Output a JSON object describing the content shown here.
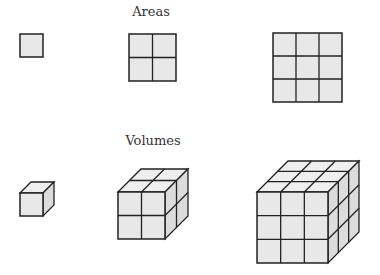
{
  "sections": {
    "areas": {
      "title": "Areas",
      "items": [
        {
          "label": "1x1 square",
          "n": 1
        },
        {
          "label": "2x2 square",
          "n": 2
        },
        {
          "label": "3x3 square",
          "n": 3
        }
      ]
    },
    "volumes": {
      "title": "Volumes",
      "items": [
        {
          "label": "1x1x1 cube",
          "n": 1
        },
        {
          "label": "2x2x2 cube",
          "n": 2
        },
        {
          "label": "3x3x3 cube",
          "n": 3
        }
      ]
    }
  },
  "colors": {
    "fill_front": "#e8e8e8",
    "fill_top": "#efefef",
    "fill_side": "#dcdcdc",
    "stroke": "#222222"
  }
}
